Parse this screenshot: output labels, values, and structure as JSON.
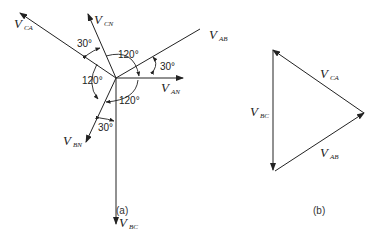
{
  "figure_a": {
    "caption": "(a)",
    "phasors": [
      {
        "name": "V_AN",
        "main": "V",
        "sub": "AN"
      },
      {
        "name": "V_BN",
        "main": "V",
        "sub": "BN"
      },
      {
        "name": "V_CN",
        "main": "V",
        "sub": "CN"
      },
      {
        "name": "V_AB",
        "main": "V",
        "sub": "AB"
      },
      {
        "name": "V_BC",
        "main": "V",
        "sub": "BC"
      },
      {
        "name": "V_CA",
        "main": "V",
        "sub": "CA"
      }
    ],
    "angles": {
      "ab_an": "30°",
      "ca_cn": "30°",
      "bn_bc": "30°",
      "cn_an": "120°",
      "ca_bn": "120°",
      "an_bn": "120°"
    }
  },
  "figure_b": {
    "caption": "(b)",
    "sides": [
      {
        "name": "V_CA",
        "main": "V",
        "sub": "CA"
      },
      {
        "name": "V_BC",
        "main": "V",
        "sub": "BC"
      },
      {
        "name": "V_AB",
        "main": "V",
        "sub": "AB"
      }
    ]
  }
}
